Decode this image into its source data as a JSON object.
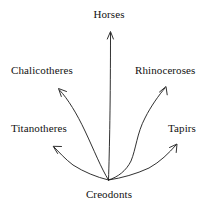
{
  "diagram": {
    "type": "evolutionary-branching-tree",
    "root": {
      "id": "creodonts",
      "label": "Creodonts"
    },
    "line_color": "#1a1a1a",
    "background_color": "#ffffff",
    "branches": [
      {
        "id": "titanotheres",
        "label": "Titanotheres",
        "direction": "left",
        "arrow": "arrowhead-up-left"
      },
      {
        "id": "chalicotheres",
        "label": "Chalicotheres",
        "direction": "upper-left",
        "arrow": "arrowhead-up-left"
      },
      {
        "id": "horses",
        "label": "Horses",
        "direction": "up",
        "arrow": "arrowhead-up"
      },
      {
        "id": "rhinoceroses",
        "label": "Rhinoceroses",
        "direction": "upper-right",
        "arrow": "arrowhead-up-right"
      },
      {
        "id": "tapirs",
        "label": "Tapirs",
        "direction": "right",
        "arrow": "arrowhead-up-right"
      }
    ]
  }
}
